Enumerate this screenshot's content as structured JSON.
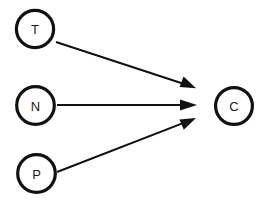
{
  "diagram": {
    "canvas": {
      "width": 268,
      "height": 211
    },
    "style": {
      "background_color": "#ffffff",
      "node_stroke_color": "#111111",
      "node_fill_color": "#ffffff",
      "node_stroke_width": 3.2,
      "edge_color": "#111111",
      "edge_stroke_width": 2.0,
      "label_color": "#1a1a1a",
      "label_font_size": 13
    },
    "nodes": [
      {
        "id": "T",
        "label": "T",
        "cx": 35,
        "cy": 29,
        "r": 18.6
      },
      {
        "id": "N",
        "label": "N",
        "cx": 35.5,
        "cy": 105.5,
        "r": 18.8
      },
      {
        "id": "P",
        "label": "P",
        "cx": 36.5,
        "cy": 173.5,
        "r": 18.8
      },
      {
        "id": "C",
        "label": "C",
        "cx": 234,
        "cy": 106,
        "r": 18.4
      }
    ],
    "edges": [
      {
        "id": "edge-t-c",
        "from": "T",
        "to": "C",
        "label": "",
        "x1": 56,
        "y1": 42,
        "x2": 196,
        "y2": 88,
        "arrow": "end"
      },
      {
        "id": "edge-n-c",
        "from": "N",
        "to": "C",
        "label": "",
        "x1": 57,
        "y1": 105,
        "x2": 197,
        "y2": 105,
        "arrow": "end"
      },
      {
        "id": "edge-p-c",
        "from": "P",
        "to": "C",
        "label": "",
        "x1": 57,
        "y1": 172,
        "x2": 196,
        "y2": 118,
        "arrow": "end"
      }
    ]
  }
}
